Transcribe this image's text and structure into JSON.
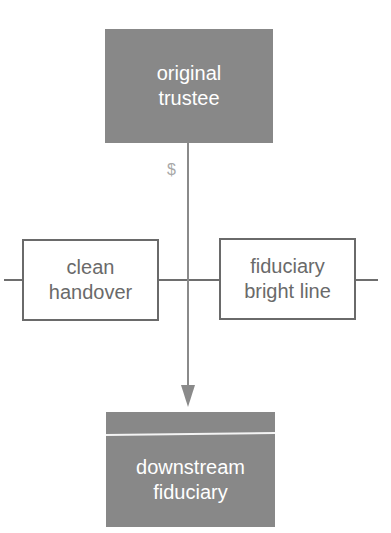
{
  "diagram": {
    "nodes": {
      "original_trustee": {
        "label": "original\ntrustee"
      },
      "clean_handover": {
        "label": "clean\nhandover"
      },
      "fiduciary_bright_line": {
        "label": "fiduciary\nbright line"
      },
      "downstream_fiduciary": {
        "label": "downstream\nfiduciary"
      }
    },
    "flow_label": "$",
    "colors": {
      "dark_box": "#888888",
      "light_box_border": "#6a6a6a",
      "line": "#6e6e6e",
      "arrow": "#8a8a8a",
      "dollar": "#a8a8a8"
    }
  }
}
